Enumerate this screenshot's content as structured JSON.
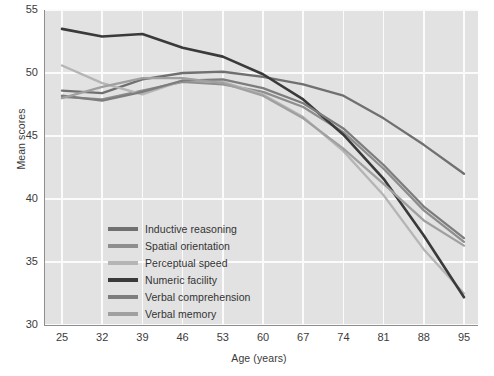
{
  "chart_data": {
    "type": "line",
    "title": "",
    "xlabel": "Age (years)",
    "ylabel": "Mean scores",
    "x": [
      25,
      32,
      39,
      46,
      53,
      60,
      67,
      74,
      81,
      88,
      95
    ],
    "xlim": [
      25,
      95
    ],
    "ylim": [
      30,
      55
    ],
    "yticks": [
      30,
      35,
      40,
      45,
      50,
      55
    ],
    "xticks": [
      25,
      32,
      39,
      46,
      53,
      60,
      67,
      74,
      81,
      88,
      95
    ],
    "grid": true,
    "legend_position": "inside lower-left",
    "series": [
      {
        "name": "Inductive reasoning",
        "color": "#707070",
        "values": [
          48.6,
          48.4,
          49.5,
          50.0,
          50.1,
          49.7,
          49.1,
          48.2,
          46.4,
          44.3,
          42.0
        ]
      },
      {
        "name": "Spatial orientation",
        "color": "#8e8e8e",
        "values": [
          48.1,
          47.9,
          48.6,
          49.3,
          49.1,
          48.5,
          47.3,
          45.3,
          42.4,
          39.1,
          36.6
        ]
      },
      {
        "name": "Perceptual speed",
        "color": "#b5b5b5",
        "values": [
          50.6,
          49.2,
          48.3,
          49.4,
          49.3,
          48.3,
          46.5,
          43.8,
          40.3,
          36.0,
          32.5
        ]
      },
      {
        "name": "Numeric facility",
        "color": "#3a3a3a",
        "values": [
          53.5,
          52.9,
          53.1,
          52.0,
          51.3,
          49.9,
          47.9,
          45.1,
          41.6,
          37.1,
          32.2
        ]
      },
      {
        "name": "Verbal comprehension",
        "color": "#7d7d7d",
        "values": [
          48.2,
          47.8,
          48.5,
          49.4,
          49.5,
          48.8,
          47.6,
          45.6,
          42.7,
          39.4,
          36.9
        ]
      },
      {
        "name": "Verbal memory",
        "color": "#a0a0a0",
        "values": [
          48.0,
          48.9,
          49.6,
          49.6,
          49.2,
          48.2,
          46.4,
          44.0,
          41.2,
          38.3,
          36.3
        ]
      }
    ]
  },
  "colors": {
    "plot_background": "#e2e2e2",
    "gridline": "#fbfbfb",
    "axis": "#8e8e8e",
    "text": "#3b3b3b"
  }
}
